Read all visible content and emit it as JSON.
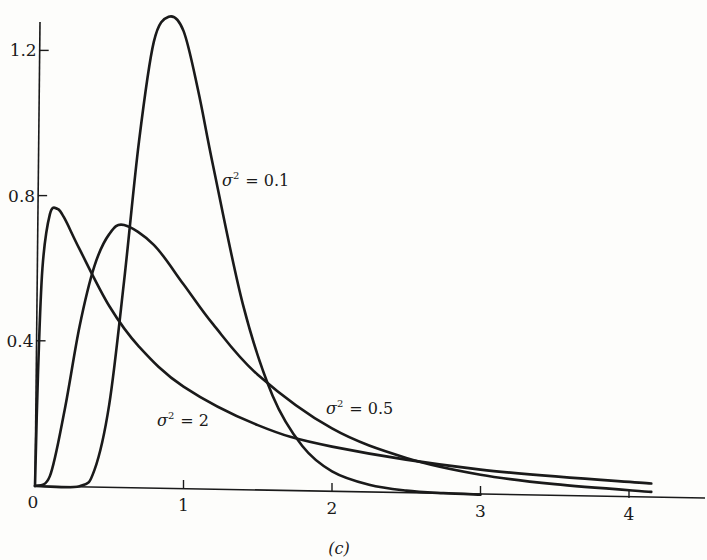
{
  "chart_data": {
    "type": "line",
    "title": "",
    "caption": "(c)",
    "xlabel": "",
    "ylabel": "",
    "xlim": [
      0,
      4.5
    ],
    "ylim": [
      0,
      1.35
    ],
    "grid": false,
    "legend": "inline annotations",
    "x_ticks": [
      0,
      1,
      2,
      3,
      4
    ],
    "x_tick_labels": [
      "0",
      "1",
      "2",
      "3",
      "4"
    ],
    "y_ticks": [
      0.4,
      0.8,
      1.2
    ],
    "y_tick_labels": [
      "0.4",
      "0.8",
      "1.2"
    ],
    "series": [
      {
        "name": "σ² = 0.1",
        "label_pos": [
          1.37,
          0.85
        ],
        "points": [
          [
            0,
            0
          ],
          [
            0.3,
            0.002
          ],
          [
            0.4,
            0.047
          ],
          [
            0.5,
            0.229
          ],
          [
            0.6,
            0.57
          ],
          [
            0.7,
            0.954
          ],
          [
            0.8,
            1.23
          ],
          [
            0.9,
            1.3
          ],
          [
            1.0,
            1.262
          ],
          [
            1.1,
            1.096
          ],
          [
            1.2,
            0.891
          ],
          [
            1.4,
            0.512
          ],
          [
            1.6,
            0.262
          ],
          [
            1.8,
            0.125
          ],
          [
            2.0,
            0.057
          ],
          [
            2.25,
            0.022
          ],
          [
            2.5,
            0.008
          ],
          [
            2.75,
            0.003
          ],
          [
            3.0,
            0.001
          ]
        ]
      },
      {
        "name": "σ² = 0.5",
        "label_pos": [
          1.98,
          0.2
        ],
        "points": [
          [
            0,
            0
          ],
          [
            0.1,
            0.028
          ],
          [
            0.2,
            0.212
          ],
          [
            0.3,
            0.442
          ],
          [
            0.4,
            0.609
          ],
          [
            0.5,
            0.698
          ],
          [
            0.6,
            0.724
          ],
          [
            0.8,
            0.671
          ],
          [
            1.0,
            0.564
          ],
          [
            1.2,
            0.455
          ],
          [
            1.5,
            0.319
          ],
          [
            2.0,
            0.175
          ],
          [
            2.5,
            0.098
          ],
          [
            3.0,
            0.056
          ],
          [
            3.5,
            0.034
          ],
          [
            4.15,
            0.018
          ]
        ]
      },
      {
        "name": "σ² = 2",
        "label_pos": [
          0.85,
          0.17
        ],
        "points": [
          [
            0,
            0
          ],
          [
            0.02,
            0.307
          ],
          [
            0.05,
            0.6
          ],
          [
            0.1,
            0.749
          ],
          [
            0.15,
            0.765
          ],
          [
            0.2,
            0.738
          ],
          [
            0.3,
            0.655
          ],
          [
            0.5,
            0.5
          ],
          [
            0.7,
            0.39
          ],
          [
            1.0,
            0.282
          ],
          [
            1.5,
            0.18
          ],
          [
            2.0,
            0.125
          ],
          [
            3.0,
            0.07
          ],
          [
            4.15,
            0.041
          ]
        ]
      }
    ]
  },
  "labels": {
    "sigma": "σ",
    "sq": "2",
    "eq_01": "= 0.1",
    "eq_05": "= 0.5",
    "eq_2": "= 2",
    "caption": "(c)"
  }
}
